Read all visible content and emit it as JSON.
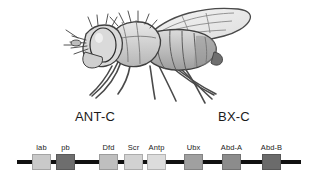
{
  "figure": {
    "organism_illustration": "drosophila-fly-lateral-view",
    "background_color": "#ffffff",
    "baseline_color": "#111111"
  },
  "clusters": [
    {
      "name": "ANT-C",
      "center_x": 95
    },
    {
      "name": "BX-C",
      "center_x": 234
    }
  ],
  "genes": [
    {
      "label": "lab",
      "box_x": 32,
      "center_x": 41.5,
      "color": "#c9c9c9"
    },
    {
      "label": "pb",
      "box_x": 56,
      "center_x": 65.5,
      "color": "#6e6e6e"
    },
    {
      "label": "Dfd",
      "box_x": 99,
      "center_x": 108.5,
      "color": "#bfbfbf"
    },
    {
      "label": "Scr",
      "box_x": 124,
      "center_x": 133.5,
      "color": "#d2d2d2"
    },
    {
      "label": "Antp",
      "box_x": 147,
      "center_x": 156.5,
      "color": "#dcdcdc"
    },
    {
      "label": "Ubx",
      "box_x": 184,
      "center_x": 193.5,
      "color": "#a0a0a0"
    },
    {
      "label": "Abd-A",
      "box_x": 222,
      "center_x": 231.5,
      "color": "#8c8c8c"
    },
    {
      "label": "Abd-B",
      "box_x": 262,
      "center_x": 271.5,
      "color": "#6b6b6b"
    }
  ],
  "palette": {
    "outline": "#3a3a3a",
    "body_light": "#e3e3e3",
    "body_mid": "#c2c2c2",
    "body_dark": "#9a9a9a",
    "eye_dark": "#2e2e2e",
    "wing_fill": "#ededed"
  }
}
